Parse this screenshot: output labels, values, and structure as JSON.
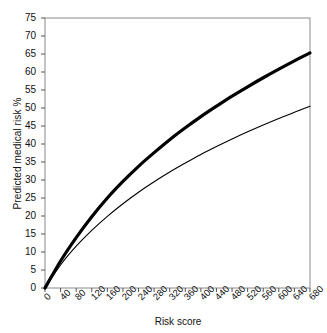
{
  "chart_data": {
    "type": "line",
    "title": "",
    "xlabel": "Risk score",
    "ylabel": "Predicted medical risk %",
    "xlim": [
      0,
      680
    ],
    "ylim": [
      0,
      75
    ],
    "grid": false,
    "legend": "none",
    "xticks": [
      "0",
      "40",
      "80",
      "120",
      "160",
      "200",
      "240",
      "280",
      "320",
      "360",
      "400",
      "440",
      "480",
      "520",
      "560",
      "600",
      "640",
      "680"
    ],
    "yticks": [
      "0",
      "5",
      "10",
      "15",
      "20",
      "25",
      "30",
      "35",
      "40",
      "45",
      "50",
      "55",
      "60",
      "65",
      "70",
      "75"
    ],
    "x": [
      0,
      40,
      80,
      120,
      160,
      200,
      240,
      280,
      320,
      360,
      400,
      440,
      480,
      520,
      560,
      600,
      640,
      680
    ],
    "series": [
      {
        "name": "upper-curve",
        "style": "thick-solid",
        "color": "#000000",
        "linewidth": 3.2,
        "values": [
          0,
          7.5,
          14.0,
          19.8,
          25.0,
          29.6,
          33.8,
          37.6,
          41.2,
          44.5,
          47.6,
          50.5,
          53.3,
          55.9,
          58.4,
          60.8,
          63.1,
          65.3
        ]
      },
      {
        "name": "lower-curve",
        "style": "thin-solid",
        "color": "#000000",
        "linewidth": 1.1,
        "values": [
          0,
          6.4,
          11.6,
          16.0,
          19.9,
          23.4,
          26.6,
          29.5,
          32.2,
          34.7,
          37.1,
          39.3,
          41.4,
          43.4,
          45.3,
          47.1,
          48.8,
          50.5
        ]
      }
    ]
  },
  "axis": {
    "frame_color": "#8a8a8a",
    "tick_color": "#555555"
  }
}
